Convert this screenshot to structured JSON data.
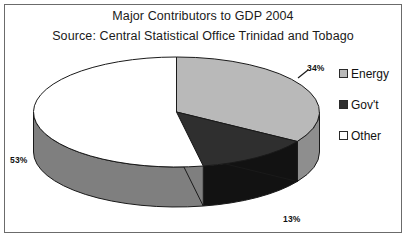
{
  "chart_data": {
    "type": "pie",
    "title": "Major Contributors to GDP 2004",
    "subtitle": "Source: Central Statistical Office Trinidad and Tobago",
    "categories": [
      "Energy",
      "Gov't",
      "Other"
    ],
    "values": [
      34,
      13,
      53
    ],
    "labels": [
      "34%",
      "13%",
      "53%"
    ],
    "unit": "%",
    "legend_position": "right",
    "three_d": true,
    "start_angle_deg": 0,
    "direction": "clockwise",
    "grid": false,
    "xlabel": "",
    "ylabel": "",
    "colors": {
      "energy_top": "#b9b9b9",
      "energy_side": "#8e8e8e",
      "govt_top": "#2f2f2f",
      "govt_side": "#121212",
      "other_top": "#ffffff",
      "other_side": "#7f7f7f",
      "outline": "#1a1a1a",
      "frame": "#6b6b6b",
      "background": "#ffffff",
      "text": "#111111"
    }
  },
  "legend": {
    "items": [
      {
        "label": "Energy",
        "swatch_color": "#b9b9b9",
        "swatch_name": "legend-swatch-energy"
      },
      {
        "label": "Gov't",
        "swatch_color": "#2f2f2f",
        "swatch_name": "legend-swatch-govt"
      },
      {
        "label": "Other",
        "swatch_color": "#ffffff",
        "swatch_name": "legend-swatch-other"
      }
    ]
  }
}
